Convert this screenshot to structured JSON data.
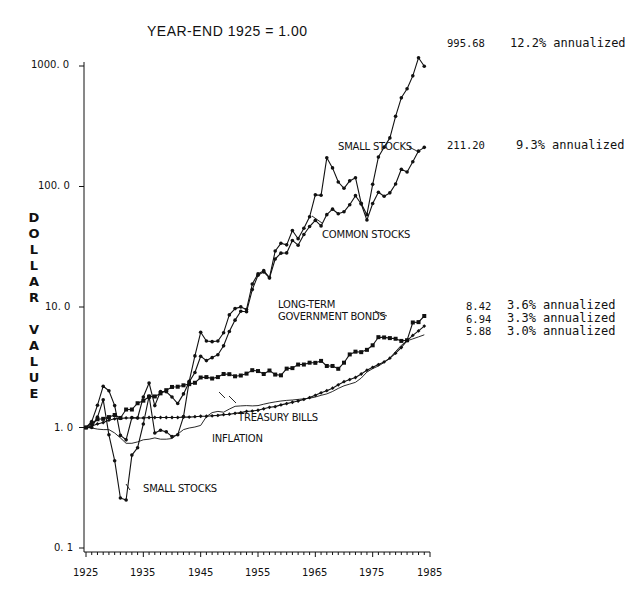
{
  "chart_data": {
    "type": "line",
    "title": "",
    "subtitle": "YEAR-END 1925 = 1.00",
    "xlabel": "",
    "ylabel": "DOLLAR VALUE",
    "yscale": "log",
    "ylim": [
      0.1,
      1000
    ],
    "xlim": [
      1925,
      1985
    ],
    "x_ticks": [
      "1925",
      "1935",
      "1945",
      "1955",
      "1965",
      "1975",
      "1985"
    ],
    "y_ticks": [
      "0. 1",
      "1. 0",
      "10. 0",
      "100. 0",
      "1000. 0"
    ],
    "grid": false,
    "legend": "inline labels",
    "x": [
      1925,
      1926,
      1927,
      1928,
      1929,
      1930,
      1931,
      1932,
      1933,
      1934,
      1935,
      1936,
      1937,
      1938,
      1939,
      1940,
      1941,
      1942,
      1943,
      1944,
      1945,
      1946,
      1947,
      1948,
      1949,
      1950,
      1951,
      1952,
      1953,
      1954,
      1955,
      1956,
      1957,
      1958,
      1959,
      1960,
      1961,
      1962,
      1963,
      1964,
      1965,
      1966,
      1967,
      1968,
      1969,
      1970,
      1971,
      1972,
      1973,
      1974,
      1975,
      1976,
      1977,
      1978,
      1979,
      1980,
      1981,
      1982,
      1983,
      1984
    ],
    "series": [
      {
        "name": "Small Stocks",
        "label": "SMALL STOCKS",
        "end_value": "995.68",
        "annualized": "12.2% annualized",
        "marker": "dot",
        "values": [
          1.0,
          1.0,
          1.22,
          1.7,
          0.87,
          0.53,
          0.26,
          0.25,
          0.59,
          0.68,
          1.07,
          1.82,
          0.9,
          0.95,
          0.92,
          0.84,
          0.87,
          1.23,
          2.42,
          3.93,
          6.17,
          5.22,
          5.16,
          5.22,
          6.12,
          8.6,
          9.7,
          10.02,
          9.54,
          15.53,
          18.83,
          20.02,
          17.51,
          29.13,
          33.79,
          32.79,
          43.17,
          36.91,
          45.07,
          56.06,
          85.22,
          84.66,
          173.01,
          142.66,
          108.99,
          96.65,
          111.38,
          118.3,
          72.46,
          58.38,
          104.22,
          175.42,
          212.01,
          253.18,
          382.06,
          544.27,
          647.37,
          828.33,
          1169.9,
          995.68
        ]
      },
      {
        "name": "Common Stocks",
        "label": "COMMON STOCKS",
        "end_value": "211.20",
        "annualized": "9.3% annualized",
        "marker": "dot",
        "values": [
          1.0,
          1.12,
          1.53,
          2.2,
          2.02,
          1.52,
          0.86,
          0.79,
          1.21,
          1.2,
          1.79,
          2.34,
          1.52,
          1.99,
          1.98,
          1.79,
          1.58,
          1.9,
          2.39,
          2.86,
          3.9,
          3.59,
          3.8,
          4.01,
          4.76,
          6.27,
          7.78,
          9.22,
          9.13,
          13.94,
          18.34,
          19.55,
          17.44,
          25.0,
          27.99,
          28.12,
          35.68,
          32.56,
          39.98,
          46.57,
          52.37,
          47.1,
          58.4,
          64.86,
          59.35,
          61.72,
          70.56,
          83.95,
          71.62,
          52.67,
          72.26,
          89.53,
          83.08,
          88.54,
          104.86,
          138.85,
          132.04,
          160.41,
          196.53,
          211.2
        ]
      },
      {
        "name": "Long-Term Government Bonds",
        "label": "LONG-TERM GOVERNMENT BONDS",
        "end_value": "8.42",
        "annualized": "3.6% annualized",
        "marker": "square",
        "values": [
          1.0,
          1.08,
          1.17,
          1.18,
          1.22,
          1.27,
          1.2,
          1.41,
          1.41,
          1.59,
          1.67,
          1.8,
          1.81,
          1.92,
          2.04,
          2.17,
          2.18,
          2.24,
          2.29,
          2.35,
          2.6,
          2.62,
          2.55,
          2.62,
          2.78,
          2.77,
          2.66,
          2.7,
          2.8,
          2.99,
          2.94,
          2.78,
          2.97,
          2.75,
          2.71,
          3.08,
          3.11,
          3.33,
          3.33,
          3.45,
          3.44,
          3.57,
          3.24,
          3.24,
          3.07,
          3.45,
          4.04,
          4.26,
          4.22,
          4.41,
          4.81,
          5.62,
          5.59,
          5.52,
          5.45,
          5.23,
          5.3,
          7.44,
          7.49,
          8.42
        ]
      },
      {
        "name": "Treasury Bills",
        "label": "TREASURY BILLS",
        "end_value": "6.94",
        "annualized": "3.3% annualized",
        "marker": "diamond",
        "values": [
          1.0,
          1.03,
          1.07,
          1.1,
          1.15,
          1.18,
          1.19,
          1.2,
          1.2,
          1.2,
          1.2,
          1.21,
          1.21,
          1.21,
          1.21,
          1.21,
          1.21,
          1.22,
          1.22,
          1.23,
          1.24,
          1.24,
          1.25,
          1.26,
          1.28,
          1.29,
          1.31,
          1.33,
          1.36,
          1.37,
          1.39,
          1.43,
          1.47,
          1.49,
          1.54,
          1.58,
          1.62,
          1.66,
          1.71,
          1.77,
          1.85,
          1.94,
          2.02,
          2.12,
          2.26,
          2.4,
          2.5,
          2.6,
          2.78,
          2.99,
          3.16,
          3.33,
          3.5,
          3.76,
          4.14,
          4.61,
          5.26,
          5.81,
          6.33,
          6.94
        ]
      },
      {
        "name": "Inflation",
        "label": "INFLATION",
        "end_value": "5.88",
        "annualized": "3.0% annualized",
        "marker": "none",
        "values": [
          1.0,
          0.99,
          0.97,
          0.96,
          0.96,
          0.9,
          0.82,
          0.74,
          0.74,
          0.76,
          0.79,
          0.8,
          0.82,
          0.8,
          0.8,
          0.81,
          0.88,
          0.96,
          0.99,
          1.01,
          1.04,
          1.23,
          1.33,
          1.36,
          1.34,
          1.42,
          1.5,
          1.51,
          1.52,
          1.51,
          1.52,
          1.56,
          1.6,
          1.63,
          1.66,
          1.68,
          1.69,
          1.71,
          1.73,
          1.75,
          1.79,
          1.85,
          1.9,
          1.99,
          2.11,
          2.22,
          2.29,
          2.37,
          2.57,
          2.88,
          3.08,
          3.24,
          3.46,
          3.77,
          4.27,
          4.81,
          5.24,
          5.44,
          5.65,
          5.88
        ]
      }
    ]
  },
  "annotations": {
    "small_stocks_upper": "SMALL STOCKS",
    "small_stocks_lower": "SMALL STOCKS",
    "common_stocks": "COMMON STOCKS",
    "bonds_line1": "LONG-TERM",
    "bonds_line2": "GOVERNMENT BONDS",
    "treasury_bills": "TREASURY BILLS",
    "inflation": "INFLATION"
  },
  "ylabel_letters": [
    "D",
    "O",
    "L",
    "L",
    "A",
    "R",
    "",
    "V",
    "A",
    "L",
    "U",
    "E"
  ]
}
